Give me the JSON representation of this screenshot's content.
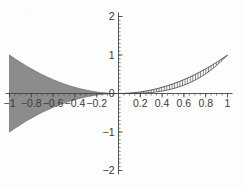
{
  "chart_data": {
    "type": "area",
    "title": "",
    "subtitle": "",
    "xlabel": "",
    "ylabel": "",
    "xlim": [
      -1,
      1
    ],
    "ylim": [
      -2,
      2
    ],
    "grid": false,
    "legend": null,
    "axis_style": "centered-cross",
    "x_ticks": [
      -1,
      -0.8,
      -0.6,
      -0.4,
      -0.2,
      0,
      0.2,
      0.4,
      0.6,
      0.8,
      1
    ],
    "x_tick_labels": [
      "-1",
      "-0.8",
      "-0.6",
      "-0.4",
      "-0.2",
      "0",
      "0.2",
      "0.4",
      "0.6",
      "0.8",
      "1"
    ],
    "y_ticks": [
      -2,
      -1,
      0,
      1,
      2
    ],
    "y_tick_labels": [
      "-2",
      "-1",
      "0",
      "1",
      "2"
    ],
    "minor_x_tick_step": 0.05,
    "minor_y_tick_step": 0.1,
    "colors": {
      "solid_fill": "#8c8c8c",
      "hatch_stroke": "#5a5a5a",
      "curve_stroke": "#4a4a4a",
      "axis": "#444444",
      "text": "#3a3a3a",
      "background": "#fdfdfd"
    },
    "series": [
      {
        "name": "left-solid-region",
        "fill_style": "solid",
        "x_range": [
          -1,
          0
        ],
        "upper_expression": "x^2",
        "lower_expression": "-x^2",
        "x": [
          -1,
          -0.95,
          -0.9,
          -0.85,
          -0.8,
          -0.75,
          -0.7,
          -0.65,
          -0.6,
          -0.55,
          -0.5,
          -0.45,
          -0.4,
          -0.35,
          -0.3,
          -0.25,
          -0.2,
          -0.15,
          -0.1,
          -0.05,
          0
        ],
        "upper": [
          1,
          0.9025,
          0.81,
          0.7225,
          0.64,
          0.5625,
          0.49,
          0.4225,
          0.36,
          0.3025,
          0.25,
          0.2025,
          0.16,
          0.1225,
          0.09,
          0.0625,
          0.04,
          0.0225,
          0.01,
          0.0025,
          0
        ],
        "lower": [
          -1,
          -0.9025,
          -0.81,
          -0.7225,
          -0.64,
          -0.5625,
          -0.49,
          -0.4225,
          -0.36,
          -0.3025,
          -0.25,
          -0.2025,
          -0.16,
          -0.1225,
          -0.09,
          -0.0625,
          -0.04,
          -0.0225,
          -0.01,
          -0.0025,
          0
        ]
      },
      {
        "name": "right-hatched-region",
        "fill_style": "vertical-hatch",
        "x_range": [
          0,
          1
        ],
        "upper_expression": "x^2",
        "lower_expression": "x^3",
        "x": [
          0,
          0.05,
          0.1,
          0.15,
          0.2,
          0.25,
          0.3,
          0.35,
          0.4,
          0.45,
          0.5,
          0.55,
          0.6,
          0.65,
          0.7,
          0.75,
          0.8,
          0.85,
          0.9,
          0.95,
          1
        ],
        "upper": [
          0,
          0.0025,
          0.01,
          0.0225,
          0.04,
          0.0625,
          0.09,
          0.1225,
          0.16,
          0.2025,
          0.25,
          0.3025,
          0.36,
          0.4225,
          0.49,
          0.5625,
          0.64,
          0.7225,
          0.81,
          0.9025,
          1
        ],
        "lower": [
          0,
          0.000125,
          0.001,
          0.003375,
          0.008,
          0.015625,
          0.027,
          0.042875,
          0.064,
          0.091125,
          0.125,
          0.166375,
          0.216,
          0.274625,
          0.343,
          0.421875,
          0.512,
          0.614125,
          0.729,
          0.857375,
          1
        ]
      }
    ]
  }
}
